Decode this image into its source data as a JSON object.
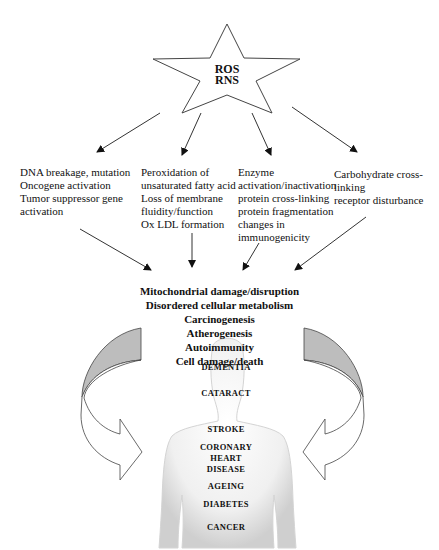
{
  "center": {
    "lines": [
      "ROS",
      "RNS"
    ]
  },
  "targets": [
    {
      "id": "dna",
      "lines": [
        "DNA breakage, mutation",
        "Oncogene activation",
        "Tumor suppressor gene",
        "activation"
      ]
    },
    {
      "id": "lipid",
      "lines": [
        "Peroxidation of",
        "unsaturated fatty acid",
        "Loss of membrane",
        "fluidity/function",
        "Ox LDL formation"
      ]
    },
    {
      "id": "protein",
      "lines": [
        "Enzyme",
        "activation/inactivation",
        "protein cross-linking",
        "protein fragmentation",
        "changes in",
        "immunogenicity"
      ]
    },
    {
      "id": "carbohydrate",
      "lines": [
        "Carbohydrate cross-",
        "linking",
        "receptor disturbance"
      ]
    }
  ],
  "effects": [
    "Mitochondrial damage/disruption",
    "Disordered cellular metabolism",
    "Carcinogenesis",
    "Atherogenesis",
    "Autoimmunity",
    "Cell damage/death"
  ],
  "diseases": [
    {
      "label": "DEMENTIA",
      "top": 362
    },
    {
      "label": "CATARACT",
      "top": 388
    },
    {
      "label": "STROKE",
      "top": 424
    },
    {
      "label": "CORONARY",
      "top": 442
    },
    {
      "label": "HEART",
      "top": 453
    },
    {
      "label": "DISEASE",
      "top": 464
    },
    {
      "label": "AGEING",
      "top": 481
    },
    {
      "label": "DIABETES",
      "top": 499
    },
    {
      "label": "CANCER",
      "top": 522
    }
  ],
  "colors": {
    "line": "#333333",
    "arrow_fill_grey": "#bdbdbd",
    "body": "#e6e6e6"
  }
}
